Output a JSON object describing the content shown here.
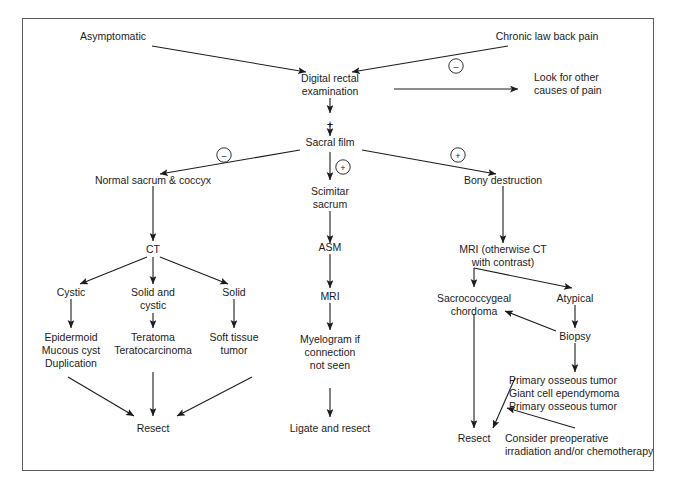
{
  "figure": {
    "type": "flowchart",
    "title": "",
    "border_color": "#5c5c5c",
    "text_color": "#1c1c1c",
    "background": "#ffffff"
  },
  "nodes": {
    "asymptomatic": "Asymptomatic",
    "chronic_back_pain": "Chronic law back pain",
    "digital_rectal_1": "Digital rectal",
    "digital_rectal_2": "examination",
    "look_other_1": "Look for other",
    "look_other_2": "causes of pain",
    "sacral_film": "Sacral film",
    "normal_sacrum": "Normal sacrum & coccyx",
    "scimitar_1": "Scimitar",
    "scimitar_2": "sacrum",
    "bony_destruction": "Bony destruction",
    "ct": "CT",
    "asm": "ASM",
    "mri_contrast_1": "MRI (otherwise CT",
    "mri_contrast_2": "with contrast)",
    "cystic": "Cystic",
    "solid_and_1": "Solid and",
    "solid_and_2": "cystic",
    "solid": "Solid",
    "mri": "MRI",
    "sacrococcygeal_1": "Sacrococcygeal",
    "sacrococcygeal_2": "chordoma",
    "atypical": "Atypical",
    "epidermoid_1": "Epidermoid",
    "epidermoid_2": "Mucous cyst",
    "epidermoid_3": "Duplication",
    "teratoma_1": "Teratoma",
    "teratoma_2": "Teratocarcinoma",
    "soft_tissue_1": "Soft tissue",
    "soft_tissue_2": "tumor",
    "myelogram_1": "Myelogram if",
    "myelogram_2": "connection",
    "myelogram_3": "not seen",
    "biopsy": "Biopsy",
    "primary_osseous_1": "Primary osseous tumor",
    "primary_osseous_2": "Giant cell ependymoma",
    "primary_osseous_3": "Primary osseous tumor",
    "resect_left": "Resect",
    "ligate_and_resect": "Ligate and resect",
    "resect_right": "Resect",
    "consider_preop_1": "Consider preoperative",
    "consider_preop_2": "irradiation and/or chemotherapy"
  },
  "signs": {
    "minus_top": "–",
    "plus_dre_sacral": "+",
    "minus_sacral_left": "–",
    "plus_sacral_mid": "+",
    "plus_sacral_right": "+"
  }
}
